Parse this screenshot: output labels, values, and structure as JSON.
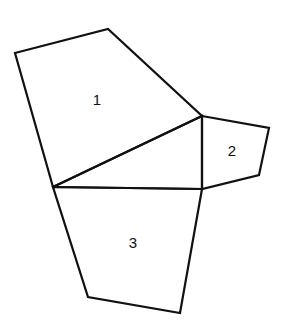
{
  "diagram": {
    "type": "polygon-net",
    "stroke_color": "#111111",
    "background": "#ffffff",
    "regions": [
      {
        "id": "1",
        "label": "1"
      },
      {
        "id": "2",
        "label": "2"
      },
      {
        "id": "3",
        "label": "3"
      },
      {
        "id": "center-triangle",
        "label": ""
      }
    ]
  }
}
